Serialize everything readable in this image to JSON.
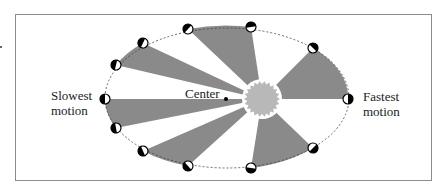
{
  "labels": {
    "slowest": [
      "Slowest",
      "motion"
    ],
    "fastest": [
      "Fastest",
      "motion"
    ],
    "center": "Center"
  },
  "colors": {
    "sector": "#8a8a8a",
    "sun": "#b8b8b8",
    "orbit": "#444444",
    "frame": "#8c8c8c"
  },
  "orbit": {
    "cx": 227,
    "cy": 98,
    "rx": 122,
    "ry": 70
  },
  "sun": {
    "cx": 262,
    "cy": 99,
    "r": 18
  },
  "center_point": {
    "x": 226,
    "y": 99
  },
  "planets": [
    {
      "x": 348,
      "y": 99
    },
    {
      "x": 313,
      "y": 48
    },
    {
      "x": 251,
      "y": 27
    },
    {
      "x": 188,
      "y": 29
    },
    {
      "x": 143,
      "y": 43
    },
    {
      "x": 116,
      "y": 65
    },
    {
      "x": 105,
      "y": 99
    },
    {
      "x": 116,
      "y": 128
    },
    {
      "x": 143,
      "y": 151
    },
    {
      "x": 188,
      "y": 166
    },
    {
      "x": 251,
      "y": 168
    },
    {
      "x": 313,
      "y": 148
    }
  ],
  "sectors": [
    [
      0,
      1
    ],
    [
      2,
      3
    ],
    [
      4,
      5
    ],
    [
      6,
      7
    ],
    [
      8,
      9
    ],
    [
      10,
      11
    ]
  ]
}
